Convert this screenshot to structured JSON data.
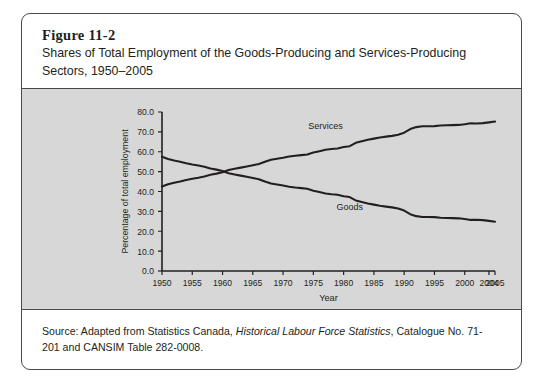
{
  "figure": {
    "number": "Figure 11-2",
    "title": "Shares of Total Employment of the Goods-Producing and Services-Producing Sectors, 1950–2005",
    "source_prefix": "Source: Adapted from Statistics Canada, ",
    "source_italic": "Historical Labour Force Statistics",
    "source_suffix": ", Catalogue No. 71-201 and CANSIM Table 282-0008."
  },
  "chart_data": {
    "type": "line",
    "title": "Shares of Total Employment of the Goods-Producing and Services-Producing Sectors, 1950–2005",
    "xlabel": "Year",
    "ylabel": "Percentage of total employment",
    "xlim": [
      1950,
      2005
    ],
    "ylim": [
      0.0,
      80.0
    ],
    "grid": false,
    "legend_position": "inline-labels",
    "ytick_labels": [
      "0.0",
      "10.0",
      "20.0",
      "30.0",
      "40.0",
      "50.0",
      "60.0",
      "70.0",
      "80.0"
    ],
    "ytick_values": [
      0,
      10,
      20,
      30,
      40,
      50,
      60,
      70,
      80
    ],
    "xtick_labels": [
      "1950",
      "1955",
      "1960",
      "1965",
      "1970",
      "1975",
      "1980",
      "1985",
      "1990",
      "1995",
      "2000",
      "2004",
      "2005"
    ],
    "xtick_values": [
      1950,
      1955,
      1960,
      1965,
      1970,
      1975,
      1980,
      1985,
      1990,
      1995,
      2000,
      2004,
      2005
    ],
    "x": [
      1950,
      1951,
      1952,
      1953,
      1954,
      1955,
      1956,
      1957,
      1958,
      1959,
      1960,
      1961,
      1962,
      1963,
      1964,
      1965,
      1966,
      1967,
      1968,
      1969,
      1970,
      1971,
      1972,
      1973,
      1974,
      1975,
      1976,
      1977,
      1978,
      1979,
      1980,
      1981,
      1982,
      1983,
      1984,
      1985,
      1986,
      1987,
      1988,
      1989,
      1990,
      1991,
      1992,
      1993,
      1994,
      1995,
      1996,
      1997,
      1998,
      1999,
      2000,
      2001,
      2002,
      2003,
      2004,
      2005
    ],
    "series": [
      {
        "name": "Services",
        "color": "#231f20",
        "label_x": 1977,
        "label_y": 71.5,
        "values": [
          42.5,
          43.6,
          44.4,
          45.0,
          45.8,
          46.4,
          46.9,
          47.5,
          48.4,
          49.0,
          49.7,
          50.8,
          51.4,
          52.0,
          52.6,
          53.2,
          53.8,
          55.0,
          56.0,
          56.5,
          57.0,
          57.6,
          58.0,
          58.3,
          58.6,
          59.6,
          60.3,
          61.0,
          61.4,
          61.6,
          62.4,
          62.8,
          64.5,
          65.3,
          66.0,
          66.6,
          67.2,
          67.6,
          68.0,
          68.6,
          69.6,
          71.4,
          72.4,
          72.8,
          72.8,
          72.9,
          73.2,
          73.3,
          73.4,
          73.5,
          73.8,
          74.3,
          74.2,
          74.4,
          74.8,
          75.2
        ]
      },
      {
        "name": "Goods",
        "color": "#231f20",
        "label_x": 1981,
        "label_y": 30.5,
        "values": [
          57.5,
          56.4,
          55.6,
          55.0,
          54.2,
          53.6,
          53.1,
          52.5,
          51.6,
          51.0,
          50.3,
          49.2,
          48.6,
          48.0,
          47.4,
          46.8,
          46.2,
          45.0,
          44.0,
          43.5,
          43.0,
          42.4,
          42.0,
          41.7,
          41.4,
          40.4,
          39.7,
          39.0,
          38.6,
          38.4,
          37.6,
          37.2,
          35.5,
          34.7,
          34.0,
          33.4,
          32.8,
          32.4,
          32.0,
          31.4,
          30.4,
          28.6,
          27.6,
          27.2,
          27.2,
          27.1,
          26.8,
          26.7,
          26.6,
          26.5,
          26.2,
          25.7,
          25.8,
          25.6,
          25.2,
          24.8
        ]
      }
    ]
  }
}
